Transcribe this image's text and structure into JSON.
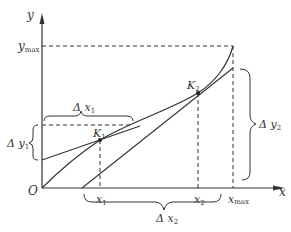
{
  "diagram": {
    "axes": {
      "x_label": "x",
      "y_label": "y",
      "origin_label": "O"
    },
    "labels": {
      "y_max": "y",
      "y_max_sub": "max",
      "x_max": "x",
      "x_max_sub": "max",
      "x1": "x",
      "x1_sub": "1",
      "x2": "x",
      "x2_sub": "2",
      "k1": "K",
      "k1_sub": "1",
      "k2": "K",
      "k2_sub": "2",
      "delta_x1": "Δ x",
      "delta_x1_sub": "1",
      "delta_y1": "Δ y",
      "delta_y1_sub": "1",
      "delta_x2": "Δ x",
      "delta_x2_sub": "2",
      "delta_y2": "Δ y",
      "delta_y2_sub": "2"
    },
    "colors": {
      "stroke": "#333333",
      "background": "#ffffff"
    }
  }
}
